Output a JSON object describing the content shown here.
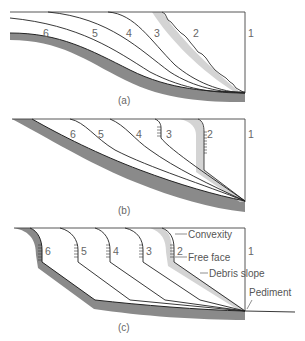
{
  "diagram": {
    "panels": [
      {
        "id": "a",
        "caption": "(a)",
        "labels": [
          "6",
          "5",
          "4",
          "3",
          "2",
          "1"
        ]
      },
      {
        "id": "b",
        "caption": "(b)",
        "labels": [
          "6",
          "5",
          "4",
          "3",
          "2",
          "1"
        ]
      },
      {
        "id": "c",
        "caption": "(c)",
        "labels": [
          "6",
          "5",
          "4",
          "3",
          "2",
          "1"
        ],
        "annotations": {
          "convexity": "Convexity",
          "free_face": "Free face",
          "debris_slope": "Debris slope",
          "pediment": "Pediment"
        }
      }
    ],
    "colors": {
      "line": "#222222",
      "bedrock": "#8a8a8a",
      "debris": "#d4d4d4",
      "label": "#666666"
    }
  }
}
